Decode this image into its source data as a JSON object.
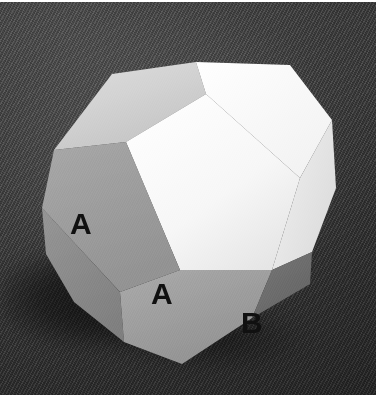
{
  "image": {
    "kind": "photograph",
    "subject": "polyhedron",
    "color_mode": "grayscale",
    "width": 386,
    "height": 398
  },
  "background": {
    "name": "dark woven fabric backdrop",
    "color": "#3b3b3b",
    "texture": "diagonal weave"
  },
  "solid": {
    "name": "polyhedron model",
    "description": "многогранник photographed on dark cloth, lit from upper area",
    "silhouette_points": "112,72 196,60 290,63 332,118 336,186 312,250 310,282 252,316 182,362 124,340 74,300 46,252 42,206 54,148",
    "faces": [
      {
        "id": "top-left-pale",
        "name": "face-top-left-pale",
        "color": "#d3d3d3",
        "points": "112,72 196,60 206,92 126,140 54,148"
      },
      {
        "id": "top-right-white",
        "name": "face-top-right-white",
        "color": "#fbfbfb",
        "points": "196,60 290,63 332,118 300,176 206,92"
      },
      {
        "id": "center-white",
        "name": "face-center-white",
        "color": "#f7f7f7",
        "points": "206,92 300,176 272,268 180,268 126,140"
      },
      {
        "id": "right-white",
        "name": "face-right-white",
        "color": "#ececec",
        "points": "300,176 332,118 336,186 312,250 272,268"
      },
      {
        "id": "left-upper-gray",
        "name": "face-left-upper-gray",
        "color": "#9c9c9c",
        "points": "54,148 126,140 180,268 120,290 42,206"
      },
      {
        "id": "left-lower-gray",
        "name": "face-left-lower-gray",
        "color": "#8c8c8c",
        "points": "42,206 120,290 124,340 74,300 46,252"
      },
      {
        "id": "bottom-gray",
        "name": "face-bottom-gray",
        "color": "#a6a6a6",
        "points": "120,290 180,268 272,268 252,316 182,362 124,340"
      },
      {
        "id": "bottom-right-dark",
        "name": "face-bottom-right-dark",
        "color": "#6e6e6e",
        "points": "272,268 312,250 310,282 252,316"
      }
    ],
    "labels": [
      {
        "id": "a1",
        "text": "A",
        "face": "face-left-upper-gray",
        "x": 82,
        "y": 228
      },
      {
        "id": "a2",
        "text": "A",
        "face": "face-bottom-gray",
        "x": 163,
        "y": 298
      },
      {
        "id": "b1",
        "text": "B",
        "face": "face-bottom-right-dark",
        "x": 253,
        "y": 327
      }
    ],
    "label_color": "#101010"
  },
  "shadow": {
    "name": "cast-shadow",
    "color": "rgba(0,0,0,0.55)",
    "direction": "lower-left"
  },
  "border": {
    "name": "paper-margin",
    "color": "#ffffff",
    "top_px": 2,
    "bottom_px": 3,
    "right_px": 10
  }
}
